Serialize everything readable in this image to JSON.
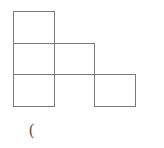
{
  "figure": {
    "line_color": "#7a7a7a",
    "cells": [
      {
        "id": "r1c1",
        "row": 1,
        "col": 1
      },
      {
        "id": "r2c1",
        "row": 2,
        "col": 1
      },
      {
        "id": "r2c2",
        "row": 2,
        "col": 2
      },
      {
        "id": "r3c1",
        "row": 3,
        "col": 1
      },
      {
        "id": "r3c2",
        "row": 3,
        "col": 2
      },
      {
        "id": "r3c3",
        "row": 3,
        "col": 3
      }
    ],
    "caption": "("
  }
}
